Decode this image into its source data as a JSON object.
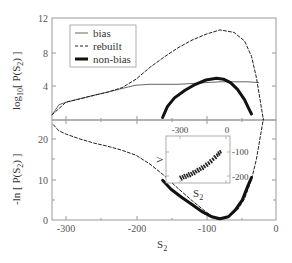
{
  "chart_data": [
    {
      "type": "line",
      "panel": "top",
      "title": "",
      "xlabel": "S2",
      "ylabel": "log10[ P(S2) ]",
      "xlim": [
        -320,
        0
      ],
      "ylim": [
        0,
        12
      ],
      "yticks": [
        4,
        8,
        12
      ],
      "ytick_labels": [
        "4",
        "8",
        "12"
      ],
      "xticks": [
        -300,
        -200,
        -100,
        0
      ],
      "grid": false,
      "legend_position": "upper left",
      "legend": [
        "bias",
        "rebuilt",
        "non-bias"
      ],
      "series": [
        {
          "name": "bias",
          "style": "thin solid",
          "x": [
            -320,
            -310,
            -300,
            -290,
            -280,
            -270,
            -260,
            -250,
            -240,
            -230,
            -220,
            -210,
            -200,
            -180,
            -160,
            -140,
            -120,
            -100,
            -80,
            -60,
            -40,
            -25
          ],
          "y": [
            0.6,
            1.8,
            2.1,
            2.3,
            2.5,
            2.7,
            2.9,
            3.1,
            3.3,
            3.5,
            3.7,
            3.9,
            4.1,
            4.2,
            4.2,
            4.2,
            4.3,
            4.4,
            4.5,
            4.5,
            4.5,
            4.4
          ]
        },
        {
          "name": "rebuilt",
          "style": "dashed",
          "x": [
            -320,
            -300,
            -280,
            -260,
            -240,
            -220,
            -200,
            -180,
            -160,
            -140,
            -120,
            -100,
            -80,
            -60,
            -45,
            -35,
            -28,
            -22,
            -18
          ],
          "y": [
            0.6,
            2.1,
            2.5,
            2.9,
            3.3,
            3.8,
            4.8,
            6.2,
            7.4,
            8.5,
            9.4,
            10.1,
            10.6,
            10.3,
            9.3,
            7.5,
            5.0,
            2.0,
            0.0
          ]
        },
        {
          "name": "non-bias",
          "style": "thick solid",
          "x": [
            -162,
            -155,
            -145,
            -130,
            -115,
            -100,
            -85,
            -75,
            -65,
            -55,
            -45,
            -38,
            -35
          ],
          "y": [
            0.3,
            1.6,
            2.6,
            3.5,
            4.2,
            4.7,
            4.9,
            4.8,
            4.4,
            3.6,
            2.4,
            1.2,
            0.7
          ]
        }
      ]
    },
    {
      "type": "line",
      "panel": "bottom",
      "title": "",
      "xlabel": "S2",
      "ylabel": "-ln [ P(S2) ]",
      "xlim": [
        -320,
        0
      ],
      "ylim": [
        0,
        25
      ],
      "xticks": [
        -300,
        -200,
        -100,
        0
      ],
      "xtick_labels": [
        "-300",
        "-200",
        "-100",
        "0"
      ],
      "yticks": [
        0,
        10,
        20
      ],
      "ytick_labels": [
        "0",
        "10",
        "20"
      ],
      "grid": false,
      "series": [
        {
          "name": "rebuilt",
          "style": "dashed",
          "x": [
            -318,
            -310,
            -300,
            -280,
            -260,
            -240,
            -220,
            -200,
            -180,
            -160,
            -140,
            -120,
            -100,
            -85,
            -70,
            -55,
            -45,
            -35,
            -28,
            -22,
            -18
          ],
          "y": [
            23.5,
            22.0,
            21.2,
            20.0,
            19.0,
            18.2,
            17.2,
            16.0,
            13.8,
            11.0,
            7.8,
            4.8,
            2.0,
            0.3,
            0.6,
            2.5,
            5.2,
            10.0,
            15.0,
            21.0,
            25.0
          ]
        },
        {
          "name": "non-bias",
          "style": "thick solid",
          "x": [
            -162,
            -150,
            -135,
            -120,
            -105,
            -92,
            -80,
            -68,
            -58,
            -48,
            -40,
            -35
          ],
          "y": [
            9.8,
            7.6,
            5.6,
            3.8,
            2.0,
            0.8,
            0.3,
            0.8,
            2.5,
            5.0,
            8.5,
            10.5
          ]
        }
      ],
      "inset": {
        "type": "scatter",
        "xlabel": "S2",
        "ylabel": "V",
        "xtick_labels": [
          "-300",
          "0"
        ],
        "ytick_labels": [
          "-100",
          "-200"
        ],
        "description": "scatter of V vs S2, increasing roughly linearly/quadratically from lower-left to upper-right",
        "x": [
          -300,
          -260,
          -220,
          -180,
          -140,
          -100,
          -60,
          -30
        ],
        "y": [
          -210,
          -200,
          -190,
          -175,
          -160,
          -140,
          -115,
          -95
        ]
      }
    }
  ],
  "legend": {
    "items": [
      {
        "label": "bias",
        "style": "thin"
      },
      {
        "label": "rebuilt",
        "style": "dashed"
      },
      {
        "label": "non-bias",
        "style": "thick"
      }
    ]
  },
  "labels": {
    "top_ylabel": "log",
    "top_ylabel_sub": "10",
    "top_ylabel_rest": "[ P(S",
    "top_ylabel_sub2": "2",
    "top_ylabel_end": ") ]",
    "bottom_ylabel": "-ln [ P(S",
    "bottom_ylabel_sub": "2",
    "bottom_ylabel_end": ") ]",
    "xlabel": "S",
    "xlabel_sub": "2",
    "inset_xlabel": "S",
    "inset_xlabel_sub": "2",
    "inset_ylabel": "V"
  },
  "ticks": {
    "top_y": [
      "12",
      "8",
      "4"
    ],
    "bottom_y": [
      "20",
      "10",
      "0"
    ],
    "bottom_x": [
      "-300",
      "-200",
      "-100",
      "0"
    ],
    "inset_top": [
      "-300",
      "0"
    ],
    "inset_right": [
      "-100",
      "-200"
    ]
  },
  "colors": {
    "frame": "#999999",
    "curve": "#111111",
    "bias": "#666666",
    "text": "#444444"
  }
}
